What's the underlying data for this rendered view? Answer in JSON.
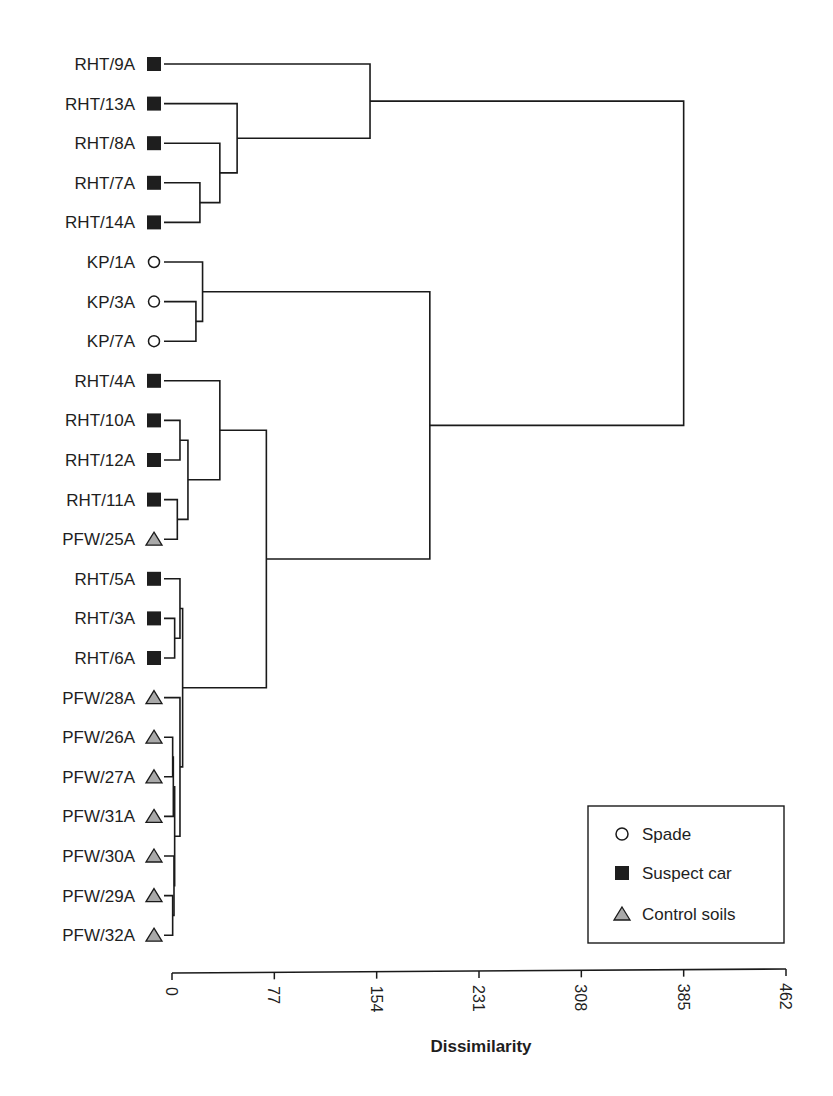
{
  "chart_data": {
    "type": "dendrogram",
    "orientation": "horizontal",
    "xlabel": "Dissimilarity",
    "xlim": [
      0,
      462
    ],
    "xticks": [
      0,
      77,
      154,
      231,
      308,
      385,
      462
    ],
    "xtick_labels": [
      "0",
      "77",
      "154",
      "231",
      "308",
      "385",
      "462"
    ],
    "leaves": [
      {
        "label": "RHT/9A",
        "group": "Suspect car"
      },
      {
        "label": "RHT/13A",
        "group": "Suspect car"
      },
      {
        "label": "RHT/8A",
        "group": "Suspect car"
      },
      {
        "label": "RHT/7A",
        "group": "Suspect car"
      },
      {
        "label": "RHT/14A",
        "group": "Suspect car"
      },
      {
        "label": "KP/1A",
        "group": "Spade"
      },
      {
        "label": "KP/3A",
        "group": "Spade"
      },
      {
        "label": "KP/7A",
        "group": "Spade"
      },
      {
        "label": "RHT/4A",
        "group": "Suspect car"
      },
      {
        "label": "RHT/10A",
        "group": "Suspect car"
      },
      {
        "label": "RHT/12A",
        "group": "Suspect car"
      },
      {
        "label": "RHT/11A",
        "group": "Suspect car"
      },
      {
        "label": "PFW/25A",
        "group": "Control soils"
      },
      {
        "label": "RHT/5A",
        "group": "Suspect car"
      },
      {
        "label": "RHT/3A",
        "group": "Suspect car"
      },
      {
        "label": "RHT/6A",
        "group": "Suspect car"
      },
      {
        "label": "PFW/28A",
        "group": "Control soils"
      },
      {
        "label": "PFW/26A",
        "group": "Control soils"
      },
      {
        "label": "PFW/27A",
        "group": "Control soils"
      },
      {
        "label": "PFW/31A",
        "group": "Control soils"
      },
      {
        "label": "PFW/30A",
        "group": "Control soils"
      },
      {
        "label": "PFW/29A",
        "group": "Control soils"
      },
      {
        "label": "PFW/32A",
        "group": "Control soils"
      }
    ],
    "merges": [
      {
        "id": "m1",
        "children": [
          "RHT/7A",
          "RHT/14A"
        ],
        "height": 21
      },
      {
        "id": "m2",
        "children": [
          "RHT/8A",
          "m1"
        ],
        "height": 36
      },
      {
        "id": "m3",
        "children": [
          "RHT/13A",
          "m2"
        ],
        "height": 49
      },
      {
        "id": "m4",
        "children": [
          "RHT/9A",
          "m3"
        ],
        "height": 149
      },
      {
        "id": "m5",
        "children": [
          "KP/3A",
          "KP/7A"
        ],
        "height": 18
      },
      {
        "id": "m6",
        "children": [
          "KP/1A",
          "m5"
        ],
        "height": 23
      },
      {
        "id": "m7",
        "children": [
          "RHT/10A",
          "RHT/12A"
        ],
        "height": 6
      },
      {
        "id": "m8",
        "children": [
          "RHT/11A",
          "PFW/25A"
        ],
        "height": 4
      },
      {
        "id": "m9",
        "children": [
          "m7",
          "m8"
        ],
        "height": 12
      },
      {
        "id": "m10",
        "children": [
          "RHT/4A",
          "m9"
        ],
        "height": 36
      },
      {
        "id": "m11",
        "children": [
          "RHT/3A",
          "RHT/6A"
        ],
        "height": 2
      },
      {
        "id": "m12",
        "children": [
          "RHT/5A",
          "m11"
        ],
        "height": 6
      },
      {
        "id": "m13",
        "children": [
          "PFW/26A",
          "PFW/27A"
        ],
        "height": 0.5
      },
      {
        "id": "m14",
        "children": [
          "m13",
          "PFW/31A"
        ],
        "height": 1
      },
      {
        "id": "m15",
        "children": [
          "PFW/29A",
          "PFW/32A"
        ],
        "height": 0.5
      },
      {
        "id": "m16",
        "children": [
          "PFW/30A",
          "m15"
        ],
        "height": 1.5
      },
      {
        "id": "m17",
        "children": [
          "m14",
          "m16"
        ],
        "height": 2
      },
      {
        "id": "m18",
        "children": [
          "PFW/28A",
          "m17"
        ],
        "height": 6
      },
      {
        "id": "m19",
        "children": [
          "m12",
          "m18"
        ],
        "height": 8
      },
      {
        "id": "m20",
        "children": [
          "m10",
          "m19"
        ],
        "height": 71
      },
      {
        "id": "m21",
        "children": [
          "m6",
          "m20"
        ],
        "height": 194
      },
      {
        "id": "m22",
        "children": [
          "m4",
          "m21"
        ],
        "height": 385
      }
    ],
    "legend": [
      {
        "label": "Spade",
        "marker": "circle-open"
      },
      {
        "label": "Suspect car",
        "marker": "square-filled"
      },
      {
        "label": "Control soils",
        "marker": "triangle-gray"
      }
    ],
    "legend_position": "lower right"
  },
  "colors": {
    "line": "#1a1a1a",
    "square": "#1e1e1e",
    "triangle_fill": "#a9a9a9",
    "circle_fill": "#ffffff"
  },
  "legend": {
    "items": [
      {
        "label": "Spade"
      },
      {
        "label": "Suspect car"
      },
      {
        "label": "Control soils"
      }
    ]
  },
  "axis": {
    "title": "Dissimilarity"
  }
}
